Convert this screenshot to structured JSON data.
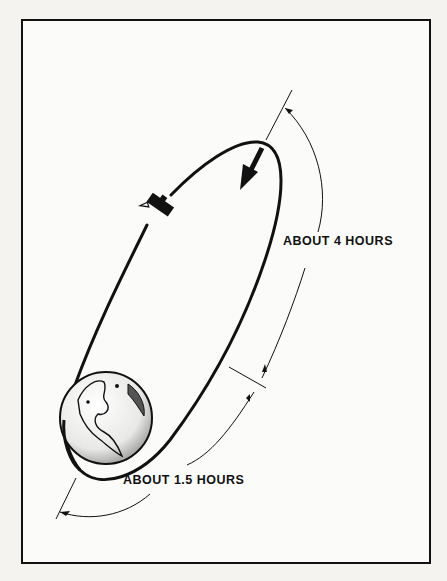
{
  "figure": {
    "type": "orbit-diagram",
    "labels": {
      "apogee_segment": "ABOUT 4 HOURS",
      "perigee_segment": "ABOUT 1.5 HOURS"
    },
    "elements": [
      "earth",
      "elliptical-orbit",
      "satellite",
      "direction-arrow",
      "time-span-arcs"
    ],
    "colors": {
      "ink": "#111111",
      "paper": "#fbfbf9",
      "background": "#f4f3f0"
    }
  }
}
